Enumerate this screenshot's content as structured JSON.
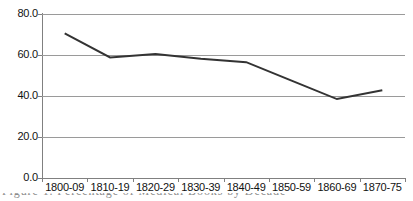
{
  "chart_data": {
    "type": "line",
    "title": "",
    "xlabel": "",
    "ylabel": "",
    "categories": [
      "1800-09",
      "1810-19",
      "1820-29",
      "1830-39",
      "1840-49",
      "1850-59",
      "1860-69",
      "1870-75"
    ],
    "values": [
      70.5,
      58.8,
      60.5,
      58.2,
      56.5,
      47.5,
      38.5,
      42.8
    ],
    "series": [
      {
        "name": "",
        "values": [
          70.5,
          58.8,
          60.5,
          58.2,
          56.5,
          47.5,
          38.5,
          42.8
        ]
      }
    ],
    "ylim": [
      0.0,
      80.0
    ],
    "ytick_labels": [
      "0.0",
      "20.0",
      "40.0",
      "60.0",
      "80.0"
    ],
    "ytick_values": [
      0.0,
      20.0,
      40.0,
      60.0,
      80.0
    ],
    "grid": "horizontal",
    "legend": "none",
    "line_color": "#333333",
    "gridline_color": "#9a9a9a",
    "axis_color": "#808080",
    "background_color": "#ffffff"
  },
  "caption": {
    "clipped_text": "Figure 1.  Percentage of Medical Books by Decade"
  }
}
